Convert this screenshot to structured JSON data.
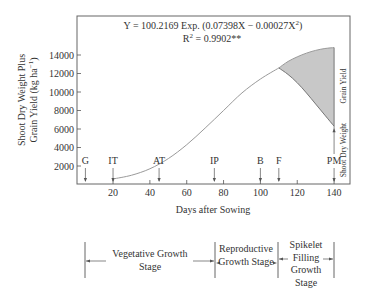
{
  "chart_data": {
    "type": "area",
    "title": "",
    "equation": "Y = 100.2169 Exp. (0.07398X − 0.00027X",
    "equation_sup": "2",
    "equation_close": ")",
    "r2_prefix": "R",
    "r2_sup": "2",
    "r2_value": " = 0.9902**",
    "xlabel": "Days after Sowing",
    "ylabel_line1": "Shoot Dry Weight Plus",
    "ylabel_line2": "Grain Yield (kg ha",
    "ylabel_sup": "−1",
    "ylabel_close": ")",
    "xlim": [
      0,
      150
    ],
    "ylim": [
      0,
      15800
    ],
    "x_ticks": [
      20,
      40,
      60,
      80,
      100,
      120,
      140
    ],
    "y_ticks": [
      2000,
      4000,
      6000,
      8000,
      10000,
      12000,
      14000
    ],
    "grid": false,
    "series": [
      {
        "name": "Shoot Dry Weight Plus Grain Yield (fitted)",
        "x": [
          20,
          30,
          40,
          50,
          60,
          70,
          80,
          90,
          100,
          110
        ],
        "y": [
          600,
          1000,
          1700,
          2800,
          4300,
          6100,
          8000,
          9900,
          11400,
          12600
        ]
      },
      {
        "name": "Grain Yield (upper envelope)",
        "x": [
          110,
          115,
          120,
          125,
          130,
          135,
          140
        ],
        "y": [
          12600,
          13300,
          13800,
          14200,
          14500,
          14700,
          14800
        ]
      },
      {
        "name": "Shoot Dry Weight (lower envelope)",
        "x": [
          110,
          115,
          120,
          125,
          130,
          135,
          140
        ],
        "y": [
          12600,
          11900,
          11000,
          9900,
          8700,
          7500,
          6300
        ]
      }
    ],
    "shaded_region_label": "Grain Yield",
    "lower_region_label": "Shoot Dry Weight",
    "markers": [
      {
        "label": "G",
        "day": 5
      },
      {
        "label": "IT",
        "day": 20
      },
      {
        "label": "AT",
        "day": 45
      },
      {
        "label": "IP",
        "day": 75
      },
      {
        "label": "B",
        "day": 100
      },
      {
        "label": "F",
        "day": 110
      },
      {
        "label": "PM",
        "day": 140
      }
    ],
    "stages": [
      {
        "lines": [
          "Vegetative Growth",
          "Stage"
        ],
        "start_day": 5,
        "end_day": 75
      },
      {
        "lines": [
          "Reproductive",
          "Growth Stage"
        ],
        "start_day": 75,
        "end_day": 110
      },
      {
        "lines": [
          "Spikelet",
          "Filling",
          "Growth",
          "Stage"
        ],
        "start_day": 110,
        "end_day": 140
      }
    ],
    "colors": {
      "line": "#9a9a9a",
      "fill": "#c8c8c8",
      "axis": "#555555",
      "text": "#333333"
    }
  }
}
